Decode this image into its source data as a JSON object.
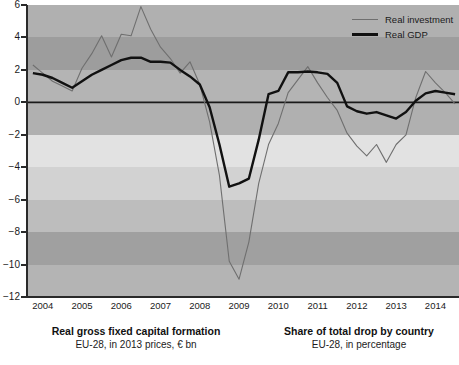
{
  "chart_data": {
    "type": "line",
    "title": "",
    "xlabel": "",
    "ylabel": "",
    "xlim": [
      2003.6,
      2014.6
    ],
    "ylim": [
      -12,
      6
    ],
    "grid": false,
    "y_ticks": [
      6,
      4,
      2,
      0,
      -2,
      -4,
      -6,
      -8,
      -10,
      -12
    ],
    "y_tick_labels": [
      "6",
      "4",
      "2",
      "0",
      "−2",
      "−4",
      "−6",
      "−8",
      "−10",
      "−12"
    ],
    "x_ticks": [
      2004,
      2005,
      2006,
      2007,
      2008,
      2009,
      2010,
      2011,
      2012,
      2013,
      2014
    ],
    "x_tick_labels": [
      "2004",
      "2005",
      "2006",
      "2007",
      "2008",
      "2009",
      "2010",
      "2011",
      "2012",
      "2013",
      "2014"
    ],
    "legend_position": "top-right",
    "zero_line": 0,
    "background_bands": [
      {
        "from": 6,
        "to": 4,
        "color": "#b0b0b0"
      },
      {
        "from": 4,
        "to": 2,
        "color": "#9d9d9d"
      },
      {
        "from": 2,
        "to": 0,
        "color": "#b4b4b4"
      },
      {
        "from": 0,
        "to": -2,
        "color": "#b0b0b0"
      },
      {
        "from": -2,
        "to": -4,
        "color": "#e2e2e2"
      },
      {
        "from": -4,
        "to": -6,
        "color": "#d2d2d2"
      },
      {
        "from": -6,
        "to": -8,
        "color": "#bdbdbd"
      },
      {
        "from": -8,
        "to": -10,
        "color": "#a0a0a0"
      },
      {
        "from": -10,
        "to": -12,
        "color": "#b4b4b4"
      }
    ],
    "series": [
      {
        "name": "Real investment",
        "color": "#6f6f6f",
        "width": 1.1,
        "x": [
          2003.75,
          2004.0,
          2004.25,
          2004.5,
          2004.75,
          2005.0,
          2005.25,
          2005.5,
          2005.75,
          2006.0,
          2006.25,
          2006.5,
          2006.75,
          2007.0,
          2007.25,
          2007.5,
          2007.75,
          2008.0,
          2008.25,
          2008.5,
          2008.75,
          2009.0,
          2009.25,
          2009.5,
          2009.75,
          2010.0,
          2010.25,
          2010.5,
          2010.75,
          2011.0,
          2011.25,
          2011.5,
          2011.75,
          2012.0,
          2012.25,
          2012.5,
          2012.75,
          2013.0,
          2013.25,
          2013.5,
          2013.75,
          2014.0,
          2014.25,
          2014.5
        ],
        "y": [
          2.3,
          1.8,
          1.3,
          1.0,
          0.7,
          2.1,
          3.0,
          4.1,
          2.8,
          4.2,
          4.1,
          5.9,
          4.5,
          3.4,
          2.7,
          1.8,
          2.5,
          1.1,
          -1.2,
          -4.5,
          -9.8,
          -10.9,
          -8.6,
          -5.0,
          -2.6,
          -1.3,
          0.6,
          1.4,
          2.2,
          1.2,
          0.3,
          -0.5,
          -1.9,
          -2.7,
          -3.3,
          -2.6,
          -3.7,
          -2.6,
          -2.0,
          0.3,
          1.9,
          1.2,
          0.6,
          -0.1
        ]
      },
      {
        "name": "Real GDP",
        "color": "#111111",
        "width": 2.4,
        "x": [
          2003.75,
          2004.0,
          2004.25,
          2004.5,
          2004.75,
          2005.0,
          2005.25,
          2005.5,
          2005.75,
          2006.0,
          2006.25,
          2006.5,
          2006.75,
          2007.0,
          2007.25,
          2007.5,
          2007.75,
          2008.0,
          2008.25,
          2008.5,
          2008.75,
          2009.0,
          2009.25,
          2009.5,
          2009.75,
          2010.0,
          2010.25,
          2010.5,
          2010.75,
          2011.0,
          2011.25,
          2011.5,
          2011.75,
          2012.0,
          2012.25,
          2012.5,
          2012.75,
          2013.0,
          2013.25,
          2013.5,
          2013.75,
          2014.0,
          2014.25,
          2014.5
        ],
        "y": [
          1.8,
          1.7,
          1.5,
          1.2,
          0.9,
          1.3,
          1.7,
          2.0,
          2.3,
          2.6,
          2.75,
          2.75,
          2.5,
          2.5,
          2.45,
          2.0,
          1.6,
          1.1,
          -0.3,
          -2.6,
          -5.2,
          -5.0,
          -4.7,
          -2.3,
          0.5,
          0.7,
          1.85,
          1.85,
          1.9,
          1.85,
          1.75,
          1.2,
          -0.25,
          -0.55,
          -0.7,
          -0.6,
          -0.8,
          -1.0,
          -0.6,
          0.1,
          0.55,
          0.7,
          0.6,
          0.5
        ]
      }
    ]
  },
  "legend": {
    "items": [
      {
        "label": "Real investment",
        "style": "thin"
      },
      {
        "label": "Real GDP",
        "style": "thick"
      }
    ]
  },
  "captions": {
    "left": {
      "title": "Real gross fixed capital formation",
      "subtitle": "EU-28, in 2013 prices, € bn"
    },
    "right": {
      "title": "Share of total drop by country",
      "subtitle": "EU-28, in percentage"
    }
  }
}
